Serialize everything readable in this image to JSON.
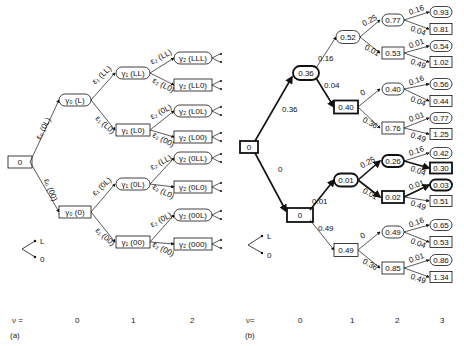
{
  "panel_a": {
    "caption": "(a)",
    "root": "0",
    "level1": [
      {
        "id": "a1u",
        "label": "γ₀ (L)",
        "shape": "oval",
        "edge": "ε₀ (0L)"
      },
      {
        "id": "a1d",
        "label": "γ₀ (0)",
        "shape": "rect",
        "edge": "ε₀ (00)"
      }
    ],
    "level2": [
      {
        "label": "γ₁ (LL)",
        "shape": "oval",
        "edge": "ε₁ (LL)"
      },
      {
        "label": "γ₁ (L0)",
        "shape": "rect",
        "edge": "ε₁ (L0)"
      },
      {
        "label": "γ₁ (0L)",
        "shape": "oval",
        "edge": "ε₁ (0L)"
      },
      {
        "label": "γ₁ (00)",
        "shape": "rect",
        "edge": "ε₁ (00)"
      }
    ],
    "level3": [
      {
        "label": "γ₂ (LLL)",
        "shape": "oval",
        "edge": "ε₂ (LL)"
      },
      {
        "label": "γ₂ (LL0)",
        "shape": "rect",
        "edge": "ε₂ (L0)"
      },
      {
        "label": "γ₂ (L0L)",
        "shape": "oval",
        "edge": "ε₂ (0L)"
      },
      {
        "label": "γ₂ (L00)",
        "shape": "rect",
        "edge": "ε₂ (00)"
      },
      {
        "label": "γ₂ (0LL)",
        "shape": "oval",
        "edge": "ε₂ (LL)"
      },
      {
        "label": "γ₂ (0L0)",
        "shape": "rect",
        "edge": "ε₂ (L0)"
      },
      {
        "label": "γ₂ (00L)",
        "shape": "oval",
        "edge": "ε₂ (0L)"
      },
      {
        "label": "γ₂ (000)",
        "shape": "rect",
        "edge": "ε₂ (00)"
      }
    ],
    "legend": {
      "up": "L",
      "down": "0"
    },
    "axis": {
      "label": "ν =",
      "ticks": [
        "0",
        "1",
        "2"
      ]
    }
  },
  "panel_b": {
    "caption": "(b)",
    "root": "0",
    "level1": [
      {
        "value": "0.36",
        "shape": "oval",
        "edge": "0.36",
        "bold": true
      },
      {
        "value": "0",
        "shape": "rect",
        "edge": "0",
        "bold": true
      }
    ],
    "level2": [
      {
        "value": "0.52",
        "shape": "oval",
        "edge": "0.16",
        "bold": false
      },
      {
        "value": "0.40",
        "shape": "rect",
        "edge": "0.04",
        "bold": true
      },
      {
        "value": "0.01",
        "shape": "oval",
        "edge": "0.01",
        "bold": true
      },
      {
        "value": "0.49",
        "shape": "rect",
        "edge": "0.49",
        "bold": false
      }
    ],
    "level3": [
      {
        "value": "0.77",
        "shape": "oval",
        "edge": "0.25",
        "bold": false
      },
      {
        "value": "0.53",
        "shape": "rect",
        "edge": "0.01",
        "bold": false
      },
      {
        "value": "0.40",
        "shape": "oval",
        "edge": "0",
        "bold": false
      },
      {
        "value": "0.76",
        "shape": "rect",
        "edge": "0.36",
        "bold": false
      },
      {
        "value": "0.26",
        "shape": "oval",
        "edge": "0.25",
        "bold": true
      },
      {
        "value": "0.02",
        "shape": "rect",
        "edge": "0.01",
        "bold": true
      },
      {
        "value": "0.49",
        "shape": "oval",
        "edge": "0",
        "bold": false
      },
      {
        "value": "0.85",
        "shape": "rect",
        "edge": "0.36",
        "bold": false
      }
    ],
    "level4": [
      {
        "value": "0.93",
        "shape": "oval",
        "edge": "0.16",
        "bold": false
      },
      {
        "value": "0.81",
        "shape": "rect",
        "edge": "0.04",
        "bold": false
      },
      {
        "value": "0.54",
        "shape": "oval",
        "edge": "0.01",
        "bold": false
      },
      {
        "value": "1.02",
        "shape": "rect",
        "edge": "0.49",
        "bold": false
      },
      {
        "value": "0.56",
        "shape": "oval",
        "edge": "0.16",
        "bold": false
      },
      {
        "value": "0.44",
        "shape": "rect",
        "edge": "0.04",
        "bold": false
      },
      {
        "value": "0.77",
        "shape": "oval",
        "edge": "0.01",
        "bold": false
      },
      {
        "value": "1.25",
        "shape": "rect",
        "edge": "0.49",
        "bold": false
      },
      {
        "value": "0.42",
        "shape": "oval",
        "edge": "0.16",
        "bold": false
      },
      {
        "value": "0.30",
        "shape": "rect",
        "edge": "0.04",
        "bold": true
      },
      {
        "value": "0.03",
        "shape": "oval",
        "edge": "0.01",
        "bold": true
      },
      {
        "value": "0.51",
        "shape": "rect",
        "edge": "0.49",
        "bold": false
      },
      {
        "value": "0.65",
        "shape": "oval",
        "edge": "0.16",
        "bold": false
      },
      {
        "value": "0.53",
        "shape": "rect",
        "edge": "0.04",
        "bold": false
      },
      {
        "value": "0.86",
        "shape": "oval",
        "edge": "0.01",
        "bold": false
      },
      {
        "value": "1.34",
        "shape": "rect",
        "edge": "0.49",
        "bold": false
      }
    ],
    "legend": {
      "up": "L",
      "down": "0"
    },
    "axis": {
      "label": "ν=",
      "ticks": [
        "0",
        "1",
        "2",
        "3"
      ]
    }
  }
}
